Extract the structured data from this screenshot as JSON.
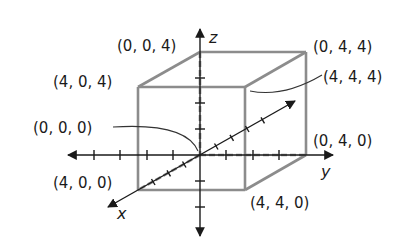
{
  "diagram": {
    "colors": {
      "axis": "#1a1a1a",
      "cube_edge": "#8c8c8c",
      "leader": "#333333",
      "background": "#ffffff"
    },
    "axes": {
      "x": {
        "label": "x"
      },
      "y": {
        "label": "y"
      },
      "z": {
        "label": "z"
      }
    },
    "vertices": [
      {
        "id": "v000",
        "label": "(0, 0, 0)"
      },
      {
        "id": "v400",
        "label": "(4, 0, 0)"
      },
      {
        "id": "v040",
        "label": "(0, 4, 0)"
      },
      {
        "id": "v004",
        "label": "(0, 0, 4)"
      },
      {
        "id": "v440",
        "label": "(4, 4, 0)"
      },
      {
        "id": "v404",
        "label": "(4, 0, 4)"
      },
      {
        "id": "v044",
        "label": "(0, 4, 4)"
      },
      {
        "id": "v444",
        "label": "(4, 4, 4)"
      }
    ]
  }
}
